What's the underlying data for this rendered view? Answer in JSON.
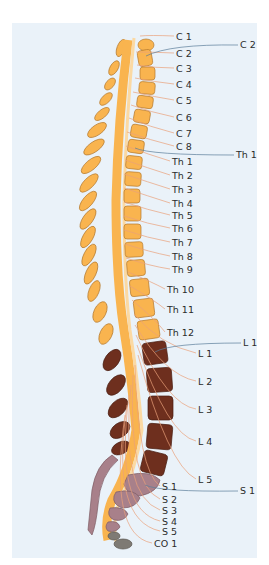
{
  "diagram": {
    "colors": {
      "background": "#eaf2f9",
      "cervical_thoracic_bone": "#f9b44f",
      "bone_outline": "#b57a2e",
      "lumbar_bone": "#6e2f1e",
      "sacral_bone": "#a8808a",
      "coccyx_bone": "#7e7a74",
      "nerve_root": "#e9a07a",
      "spinal_cord": "#fbd9a3",
      "leader_line_vertebra": "#5a7d9a",
      "label_text": "#2b2b2b"
    },
    "nerve_labels": [
      {
        "id": "C1",
        "text": "C 1",
        "x": 176,
        "y": 40
      },
      {
        "id": "C2",
        "text": "C 2",
        "x": 176,
        "y": 57
      },
      {
        "id": "C3",
        "text": "C 3",
        "x": 176,
        "y": 72
      },
      {
        "id": "C4",
        "text": "C 4",
        "x": 176,
        "y": 88
      },
      {
        "id": "C5",
        "text": "C 5",
        "x": 176,
        "y": 104
      },
      {
        "id": "C6",
        "text": "C 6",
        "x": 176,
        "y": 121
      },
      {
        "id": "C7",
        "text": "C 7",
        "x": 176,
        "y": 137
      },
      {
        "id": "C8",
        "text": "C 8",
        "x": 176,
        "y": 150
      },
      {
        "id": "Th1",
        "text": "Th 1",
        "x": 172,
        "y": 165
      },
      {
        "id": "Th2",
        "text": "Th 2",
        "x": 172,
        "y": 179
      },
      {
        "id": "Th3",
        "text": "Th 3",
        "x": 172,
        "y": 193
      },
      {
        "id": "Th4",
        "text": "Th 4",
        "x": 172,
        "y": 207
      },
      {
        "id": "Th5",
        "text": "Th 5",
        "x": 172,
        "y": 219
      },
      {
        "id": "Th6",
        "text": "Th 6",
        "x": 172,
        "y": 232
      },
      {
        "id": "Th7",
        "text": "Th 7",
        "x": 172,
        "y": 246
      },
      {
        "id": "Th8",
        "text": "Th 8",
        "x": 172,
        "y": 260
      },
      {
        "id": "Th9",
        "text": "Th 9",
        "x": 172,
        "y": 273
      },
      {
        "id": "Th10",
        "text": "Th 10",
        "x": 167,
        "y": 293
      },
      {
        "id": "Th11",
        "text": "Th 11",
        "x": 167,
        "y": 313
      },
      {
        "id": "Th12",
        "text": "Th 12",
        "x": 167,
        "y": 336
      },
      {
        "id": "L1",
        "text": "L 1",
        "x": 198,
        "y": 357
      },
      {
        "id": "L2",
        "text": "L 2",
        "x": 198,
        "y": 385
      },
      {
        "id": "L3",
        "text": "L 3",
        "x": 198,
        "y": 413
      },
      {
        "id": "L4",
        "text": "L 4",
        "x": 198,
        "y": 445
      },
      {
        "id": "L5",
        "text": "L 5",
        "x": 198,
        "y": 483
      },
      {
        "id": "S1",
        "text": "S 1",
        "x": 162,
        "y": 490
      },
      {
        "id": "S2",
        "text": "S 2",
        "x": 162,
        "y": 503
      },
      {
        "id": "S3",
        "text": "S 3",
        "x": 162,
        "y": 514
      },
      {
        "id": "S4",
        "text": "S 4",
        "x": 162,
        "y": 525
      },
      {
        "id": "S5",
        "text": "S 5",
        "x": 162,
        "y": 535
      },
      {
        "id": "CO1",
        "text": "CO 1",
        "x": 154,
        "y": 547
      }
    ],
    "vertebra_labels": [
      {
        "id": "C2v",
        "text": "C 2",
        "x": 240,
        "y": 48
      },
      {
        "id": "Th1v",
        "text": "Th 1",
        "x": 236,
        "y": 158
      },
      {
        "id": "L1v",
        "text": "L 1",
        "x": 243,
        "y": 346
      },
      {
        "id": "S1v",
        "text": "S 1",
        "x": 240,
        "y": 494
      }
    ]
  }
}
